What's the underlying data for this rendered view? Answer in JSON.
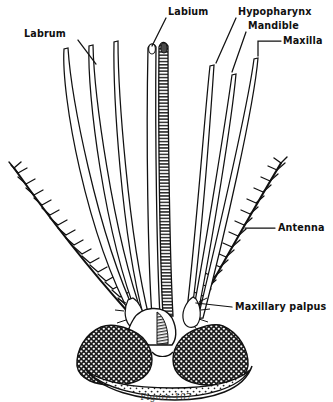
{
  "figure": {
    "domain_kind": "scientific-anatomical-illustration",
    "caption": "Figure 107",
    "background_color": "#ffffff",
    "ink_color": "#101010"
  },
  "labels": [
    {
      "id": "labrum",
      "text": "Labrum",
      "x": 24,
      "y": 37,
      "anchor": "start",
      "leader": "M 78 40 L 96 64"
    },
    {
      "id": "labium",
      "text": "Labium",
      "x": 168,
      "y": 15,
      "anchor": "start",
      "leader": "M 166 18 L 152 46"
    },
    {
      "id": "hypopharynx",
      "text": "Hypopharynx",
      "x": 238,
      "y": 15,
      "anchor": "start",
      "leader": "M 236 18 L 216 63"
    },
    {
      "id": "mandible",
      "text": "Mandible",
      "x": 248,
      "y": 29,
      "anchor": "start",
      "leader": "M 246 32 L 232 72"
    },
    {
      "id": "maxilla",
      "text": "Maxilla",
      "x": 283,
      "y": 44,
      "anchor": "start",
      "leader": "M 281 41 L 258 41 L 258 56"
    },
    {
      "id": "antenna",
      "text": "Antenna",
      "x": 278,
      "y": 231,
      "anchor": "start",
      "leader": "M 275 228 L 245 228"
    },
    {
      "id": "maxillary-palpus",
      "text": "Maxillary palpus",
      "x": 235,
      "y": 310,
      "anchor": "start",
      "leader": "M 232 307 L 196 303"
    }
  ],
  "parts": {
    "left_stylets": [
      {
        "id": "left-stylet-1",
        "name": "labrum-stylet-outer"
      },
      {
        "id": "left-stylet-2",
        "name": "labrum-stylet-middle"
      },
      {
        "id": "left-stylet-3",
        "name": "labrum-stylet-inner"
      }
    ],
    "right_stylets": [
      {
        "id": "right-stylet-1",
        "name": "hypopharynx-stylet"
      },
      {
        "id": "right-stylet-2",
        "name": "mandible-stylet"
      },
      {
        "id": "right-stylet-3",
        "name": "maxilla-stylet"
      }
    ],
    "labium": {
      "id": "labium-shaft",
      "name": "labium-banded-shaft",
      "segments": 34
    },
    "antennae": {
      "left": "left-plumose-antenna",
      "right": "right-plumose-antenna",
      "whorls": 17
    },
    "palpi": {
      "left": "left-maxillary-palpus",
      "right": "right-maxillary-palpus"
    },
    "head": {
      "id": "head-capsule",
      "eyes": 2,
      "clypeus": "clypeus-plate"
    }
  }
}
